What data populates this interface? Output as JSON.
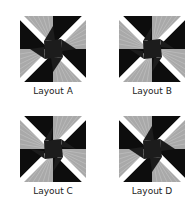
{
  "colors": {
    "black": "#0d0d0d",
    "gray": "#a9a9a9",
    "stripe": "#c4c4c4",
    "white": "#ffffff",
    "center": "#1c1c1c"
  },
  "layouts": [
    {
      "label": "Layout A",
      "x": 20,
      "y": 16,
      "label_x": 3,
      "label_y": 86,
      "quadrants": {
        "tl": "ccw",
        "tr": "ccw",
        "bl": "ccw",
        "br": "ccw"
      },
      "pinwheel": "cw"
    },
    {
      "label": "Layout B",
      "x": 119,
      "y": 16,
      "label_x": 102,
      "label_y": 86,
      "quadrants": {
        "tl": "cw",
        "tr": "cw",
        "bl": "cw",
        "br": "cw"
      },
      "pinwheel": "ccw"
    },
    {
      "label": "Layout C",
      "x": 20,
      "y": 116,
      "label_x": 3,
      "label_y": 186,
      "quadrants": {
        "tl": "cw",
        "tr": "cw",
        "bl": "cw",
        "br": "cw"
      },
      "pinwheel": "ccw"
    },
    {
      "label": "Layout D",
      "x": 119,
      "y": 116,
      "label_x": 102,
      "label_y": 186,
      "quadrants": {
        "tl": "ccw",
        "tr": "ccw",
        "bl": "ccw",
        "br": "ccw"
      },
      "pinwheel": "cw"
    }
  ]
}
